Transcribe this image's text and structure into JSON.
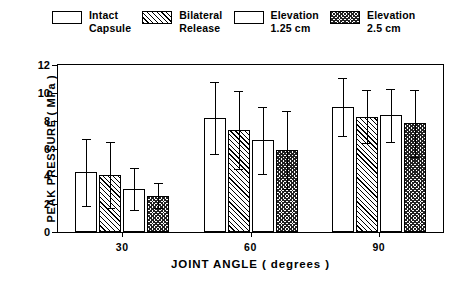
{
  "legend": {
    "position": "top",
    "items": [
      {
        "label": "Intact\nCapsule",
        "pattern": "solid-white",
        "swatch_name": "legend-swatch-intact-capsule"
      },
      {
        "label": "Bilateral\nRelease",
        "pattern": "diagonal",
        "swatch_name": "legend-swatch-bilateral-release"
      },
      {
        "label": "Elevation\n1.25 cm",
        "pattern": "solid-white",
        "swatch_name": "legend-swatch-elevation-125"
      },
      {
        "label": "Elevation\n2.5 cm",
        "pattern": "checker",
        "swatch_name": "legend-swatch-elevation-25"
      }
    ]
  },
  "chart_data": {
    "type": "bar",
    "title": "",
    "xlabel": "JOINT  ANGLE  (  degrees  )",
    "ylabel": "PEAK  PRESSURE  (  MPa  )",
    "categories": [
      "30",
      "60",
      "90"
    ],
    "ylim": [
      0,
      12
    ],
    "yticks": [
      0,
      2,
      4,
      6,
      8,
      10,
      12
    ],
    "yticklabels": [
      "0",
      "2",
      "4",
      "6",
      "8",
      "10",
      "12"
    ],
    "grid": false,
    "errorbar_type": "standard deviation",
    "series": [
      {
        "name": "Intact Capsule",
        "pattern": "solid-white",
        "values": [
          4.3,
          8.2,
          9.0
        ],
        "err_upper": [
          2.4,
          2.6,
          2.1
        ],
        "err_lower": [
          2.4,
          2.6,
          2.1
        ]
      },
      {
        "name": "Bilateral Release",
        "pattern": "diagonal",
        "values": [
          4.1,
          7.3,
          8.3
        ],
        "err_upper": [
          2.4,
          2.8,
          1.9
        ],
        "err_lower": [
          2.4,
          2.8,
          1.9
        ]
      },
      {
        "name": "Elevation 1.25 cm",
        "pattern": "solid-white",
        "values": [
          3.1,
          6.6,
          8.4
        ],
        "err_upper": [
          1.5,
          2.4,
          1.9
        ],
        "err_lower": [
          1.5,
          2.4,
          1.9
        ]
      },
      {
        "name": "Elevation 2.5 cm",
        "pattern": "checker",
        "values": [
          2.6,
          5.9,
          7.8
        ],
        "err_upper": [
          0.9,
          2.8,
          2.4
        ],
        "err_lower": [
          0.9,
          2.8,
          2.4
        ]
      }
    ]
  },
  "colors": {
    "ink": "#000000",
    "background": "#ffffff"
  }
}
